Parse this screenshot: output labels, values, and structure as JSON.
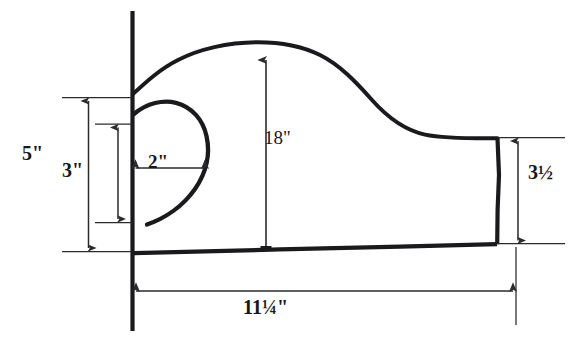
{
  "figure": {
    "background_color": "#ffffff",
    "ink_color": "#17171a",
    "outline_color": "#1a1a1d",
    "dimension_line_color": "#2b2b2e"
  },
  "dimensions": {
    "height_overall": {
      "label": "5\"",
      "value": 5,
      "unit": "inch",
      "orientation": "vertical",
      "position": "far-left"
    },
    "scroll_height": {
      "label": "3\"",
      "value": 3,
      "unit": "inch",
      "orientation": "vertical",
      "position": "left-inner"
    },
    "scroll_depth": {
      "label": "2\"",
      "value": 2,
      "unit": "inch",
      "orientation": "horizontal",
      "position": "inside-scroll"
    },
    "arm_height": {
      "label": "18\"",
      "value": 18,
      "unit": "inch",
      "orientation": "vertical",
      "position": "center"
    },
    "tail_height": {
      "label": "3½",
      "value": 3.5,
      "unit": "inch",
      "orientation": "vertical",
      "position": "right"
    },
    "overall_length": {
      "label": "11¼\"",
      "value": 11.25,
      "unit": "inch",
      "orientation": "horizontal",
      "position": "bottom"
    }
  },
  "label_parts": {
    "width_whole": "11",
    "width_fraction": "¼",
    "width_mark": "\"",
    "tail_whole": "3",
    "tail_fraction": "½"
  }
}
